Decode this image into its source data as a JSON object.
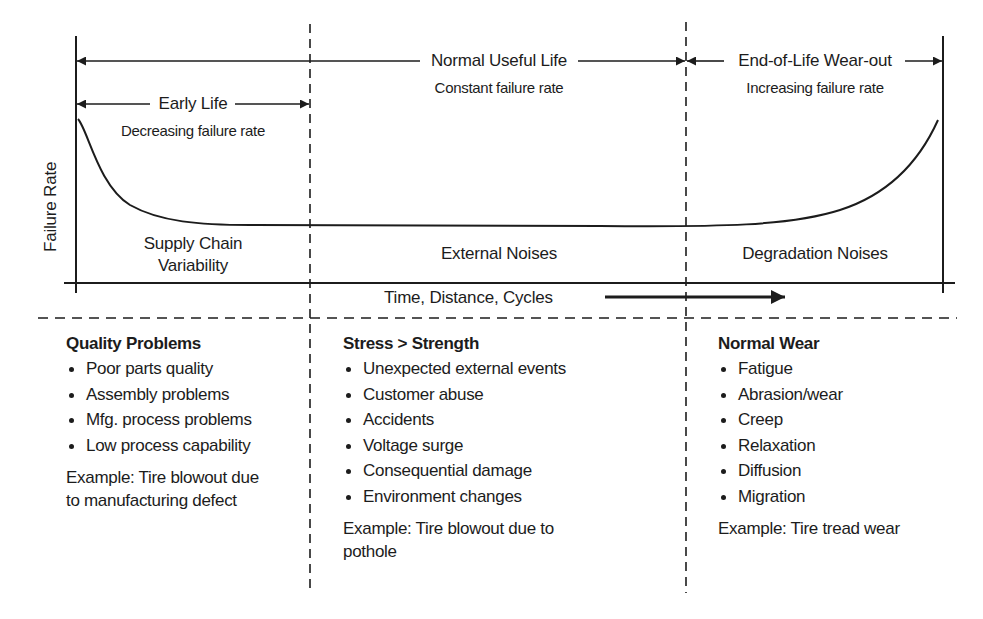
{
  "diagram": {
    "y_axis_label": "Failure Rate",
    "x_axis_label": "Time, Distance, Cycles",
    "phases": [
      {
        "id": "early",
        "title": "Early Life",
        "subtitle": "Decreasing failure rate",
        "noise": [
          "Supply Chain",
          "Variability"
        ]
      },
      {
        "id": "useful",
        "title": "Normal Useful Life",
        "subtitle": "Constant failure rate",
        "noise": [
          "External Noises"
        ]
      },
      {
        "id": "wearout",
        "title": "End-of-Life Wear-out",
        "subtitle": "Increasing failure rate",
        "noise": [
          "Degradation Noises"
        ]
      }
    ],
    "causes": [
      {
        "heading": "Quality Problems",
        "items": [
          "Poor parts quality",
          "Assembly problems",
          "Mfg. process problems",
          "Low process capability"
        ],
        "example": [
          "Example: Tire blowout due",
          "to manufacturing defect"
        ]
      },
      {
        "heading": "Stress > Strength",
        "items": [
          "Unexpected external events",
          "Customer abuse",
          "Accidents",
          "Voltage surge",
          "Consequential damage",
          "Environment changes"
        ],
        "example": [
          "Example: Tire blowout due to",
          "pothole"
        ]
      },
      {
        "heading": "Normal Wear",
        "items": [
          "Fatigue",
          "Abrasion/wear",
          "Creep",
          "Relaxation",
          "Diffusion",
          "Migration"
        ],
        "example": [
          "Example: Tire tread wear"
        ]
      }
    ],
    "colors": {
      "line": "#1c1c1c",
      "background": "#ffffff"
    }
  }
}
